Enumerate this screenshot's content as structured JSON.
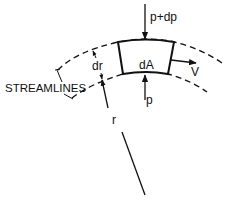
{
  "diagram": {
    "colors": {
      "line": "#111111",
      "background": "#ffffff"
    },
    "labels": {
      "pressure_top": "p+dp",
      "pressure_bottom": "p",
      "element_area": "dA",
      "velocity": "V",
      "thickness": "dr",
      "radius": "r",
      "streamlines": "STREAMLINES"
    },
    "elements": [
      {
        "id": "outer-streamline",
        "type": "dashed-curve"
      },
      {
        "id": "inner-streamline",
        "type": "dashed-curve"
      },
      {
        "id": "fluid-element",
        "type": "curved-quadrilateral",
        "label": "dA"
      },
      {
        "id": "arrow-p-plus-dp",
        "direction": "down",
        "label": "p+dp"
      },
      {
        "id": "arrow-p",
        "direction": "up",
        "label": "p"
      },
      {
        "id": "arrow-v",
        "direction": "right",
        "label": "V"
      },
      {
        "id": "dimension-dr",
        "label": "dr"
      },
      {
        "id": "radius-line",
        "label": "r"
      },
      {
        "id": "streamlines-callout",
        "label": "STREAMLINES"
      }
    ]
  }
}
